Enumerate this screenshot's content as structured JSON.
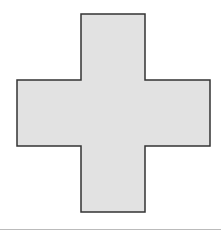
{
  "figure": {
    "shape": "cross",
    "fill": "#e2e2e2",
    "stroke": "#333333",
    "divider_color": "#bbbbbb"
  }
}
